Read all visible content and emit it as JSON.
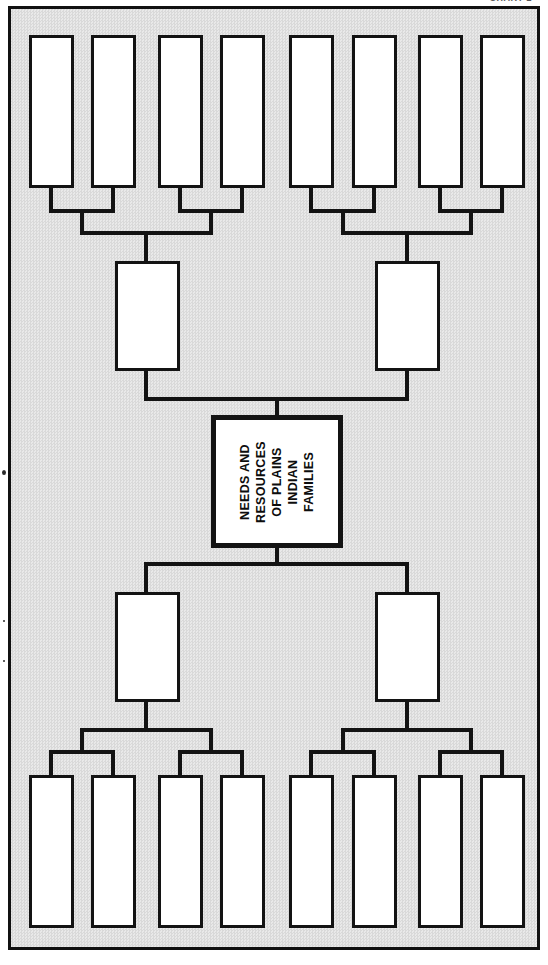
{
  "page": {
    "width": 548,
    "height": 965,
    "background_color": "#ffffff",
    "frame_background_color": "#e2e2e2",
    "line_color": "#131313"
  },
  "top_caption": {
    "text": "CHART 2",
    "truncated": true
  },
  "diagram": {
    "type": "hierarchy-tree",
    "orientation": "vertical-symmetric",
    "center_node": {
      "label": "NEEDS AND\nRESOURCES\nOF PLAINS\nINDIAN\nFAMILIES",
      "text_rotation_deg": -90
    },
    "top_branch": {
      "mid_nodes": [
        {
          "label": ""
        },
        {
          "label": ""
        }
      ],
      "leaf_nodes": [
        {
          "label": ""
        },
        {
          "label": ""
        },
        {
          "label": ""
        },
        {
          "label": ""
        },
        {
          "label": ""
        },
        {
          "label": ""
        },
        {
          "label": ""
        },
        {
          "label": ""
        }
      ]
    },
    "bottom_branch": {
      "mid_nodes": [
        {
          "label": ""
        },
        {
          "label": ""
        }
      ],
      "leaf_nodes": [
        {
          "label": ""
        },
        {
          "label": ""
        },
        {
          "label": ""
        },
        {
          "label": ""
        },
        {
          "label": ""
        },
        {
          "label": ""
        },
        {
          "label": ""
        },
        {
          "label": ""
        }
      ]
    }
  }
}
